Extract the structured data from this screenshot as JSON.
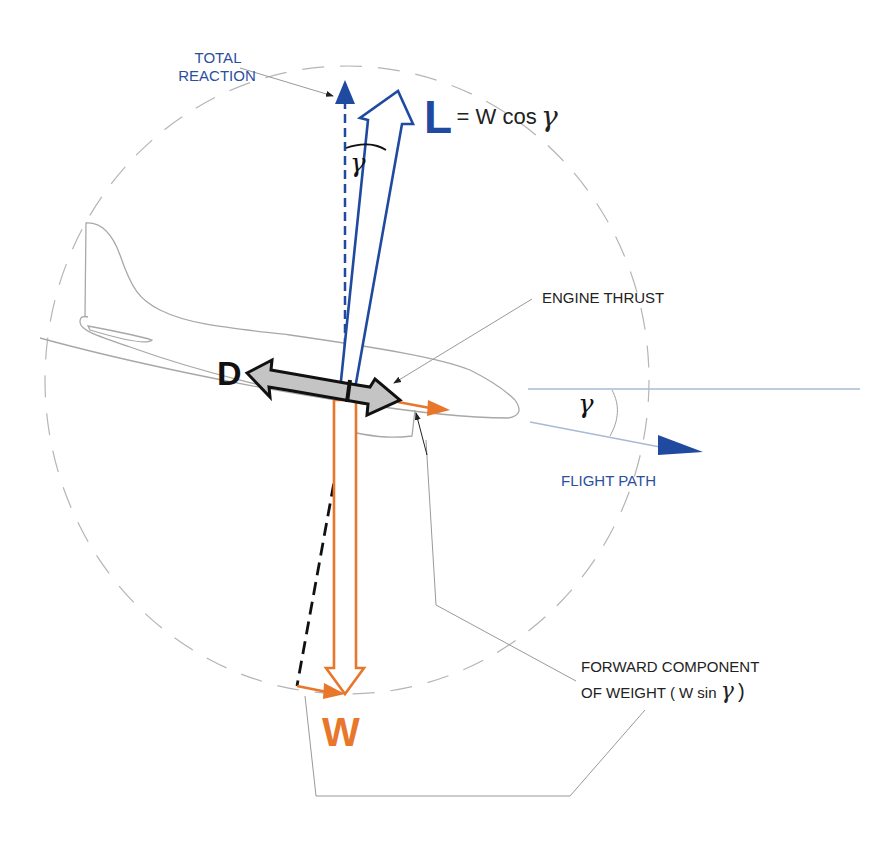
{
  "diagram": {
    "title_partial": "...ON DESCENT",
    "colors": {
      "lift_blue": "#1f4aa0",
      "label_blue": "#2b4f9e",
      "weight_orange": "#e8762b",
      "drag_grey": "#c0c0c0",
      "outline_grey": "#9a9a9a",
      "text_dark": "#222222"
    },
    "labels": {
      "total_reaction_line1": "TOTAL",
      "total_reaction_line2": "REACTION",
      "lift_symbol": "L",
      "lift_equation_eq": "= W cos",
      "gamma": "γ",
      "gamma_top": "γ",
      "gamma_right": "γ",
      "engine_thrust": "ENGINE  THRUST",
      "drag_symbol": "D",
      "flight_path": "FLIGHT  PATH",
      "forward_component_line1": "FORWARD  COMPONENT",
      "forward_component_line2_text": "OF WEIGHT  ( W  sin",
      "forward_component_line2_gamma": "γ",
      "forward_component_line2_close": " )",
      "weight_symbol": "W"
    },
    "forces": [
      {
        "name": "Total Reaction",
        "direction": "vertical up",
        "style": "dashed blue arrow"
      },
      {
        "name": "Lift (L)",
        "expression": "W cos γ",
        "style": "hollow blue arrow"
      },
      {
        "name": "Drag (D)",
        "style": "grey double-headed arrow"
      },
      {
        "name": "Engine Thrust",
        "style": "grey arrow head pointing forward"
      },
      {
        "name": "Weight (W)",
        "direction": "vertical down",
        "style": "hollow orange arrow"
      },
      {
        "name": "Forward component of weight",
        "expression": "W sin γ",
        "style": "orange small arrow"
      }
    ],
    "angle": "γ (flight path angle)"
  }
}
